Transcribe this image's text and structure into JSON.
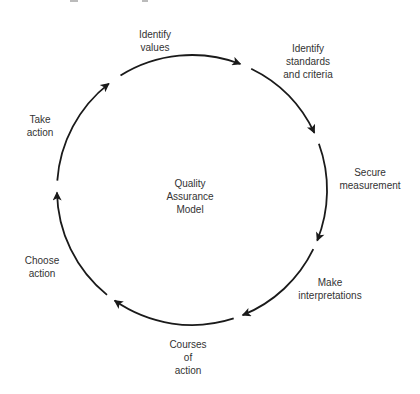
{
  "diagram": {
    "title": "Quality Assurance Model",
    "center_label": [
      "Quality",
      "Assurance",
      "Model"
    ],
    "stroke_color": "#1a1a1a",
    "steps": [
      {
        "id": "identify-values",
        "lines": [
          "Identify",
          "values"
        ]
      },
      {
        "id": "identify-standards",
        "lines": [
          "Identify",
          "standards",
          "and criteria"
        ]
      },
      {
        "id": "secure-measurement",
        "lines": [
          "Secure",
          "measurement"
        ]
      },
      {
        "id": "make-interpretations",
        "lines": [
          "Make",
          "interpretations"
        ]
      },
      {
        "id": "courses-of-action",
        "lines": [
          "Courses",
          "of",
          "action"
        ]
      },
      {
        "id": "choose-action",
        "lines": [
          "Choose",
          "action"
        ]
      },
      {
        "id": "take-action",
        "lines": [
          "Take",
          "action"
        ]
      }
    ],
    "flow": "clockwise cycle"
  }
}
